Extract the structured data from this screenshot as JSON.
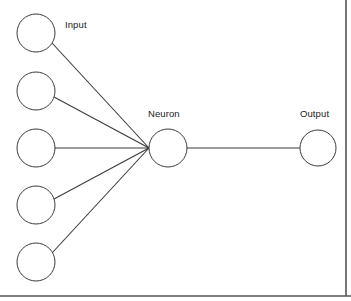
{
  "diagram": {
    "background_color": "#ffffff",
    "stroke_color": "#3c3c3c",
    "frame_color": "#555555",
    "labels": {
      "input": "Input",
      "neuron": "Neuron",
      "output": "Output"
    },
    "input_nodes": [
      {
        "id": "input-node-1",
        "cx": 36,
        "cy": 33,
        "r": 19
      },
      {
        "id": "input-node-2",
        "cx": 36,
        "cy": 91,
        "r": 19
      },
      {
        "id": "input-node-3",
        "cx": 36,
        "cy": 148,
        "r": 19
      },
      {
        "id": "input-node-4",
        "cx": 36,
        "cy": 205,
        "r": 19
      },
      {
        "id": "input-node-5",
        "cx": 36,
        "cy": 262,
        "r": 19
      }
    ],
    "neuron_node": {
      "id": "neuron-node",
      "cx": 168,
      "cy": 148,
      "r": 19
    },
    "output_node": {
      "id": "output-node",
      "cx": 318,
      "cy": 148,
      "r": 18
    },
    "edges": [
      {
        "id": "edge-input-1-neuron",
        "x1": 52,
        "y1": 43,
        "x2": 149,
        "y2": 148
      },
      {
        "id": "edge-input-2-neuron",
        "x1": 54,
        "y1": 97,
        "x2": 149,
        "y2": 148
      },
      {
        "id": "edge-input-3-neuron",
        "x1": 55,
        "y1": 148,
        "x2": 149,
        "y2": 148
      },
      {
        "id": "edge-input-4-neuron",
        "x1": 54,
        "y1": 199,
        "x2": 149,
        "y2": 148
      },
      {
        "id": "edge-input-5-neuron",
        "x1": 52,
        "y1": 253,
        "x2": 149,
        "y2": 148
      },
      {
        "id": "edge-neuron-output",
        "x1": 187,
        "y1": 148,
        "x2": 300,
        "y2": 148
      }
    ],
    "label_positions": {
      "input": {
        "left": 65,
        "top": 19
      },
      "neuron": {
        "left": 148,
        "top": 108
      },
      "output": {
        "left": 300,
        "top": 108
      }
    },
    "frame": {
      "bottom_rule": {
        "x1": 0,
        "y1": 296,
        "x2": 351,
        "y2": 296
      },
      "right_rule": {
        "x1": 346,
        "y1": 0,
        "x2": 346,
        "y2": 296
      }
    }
  }
}
